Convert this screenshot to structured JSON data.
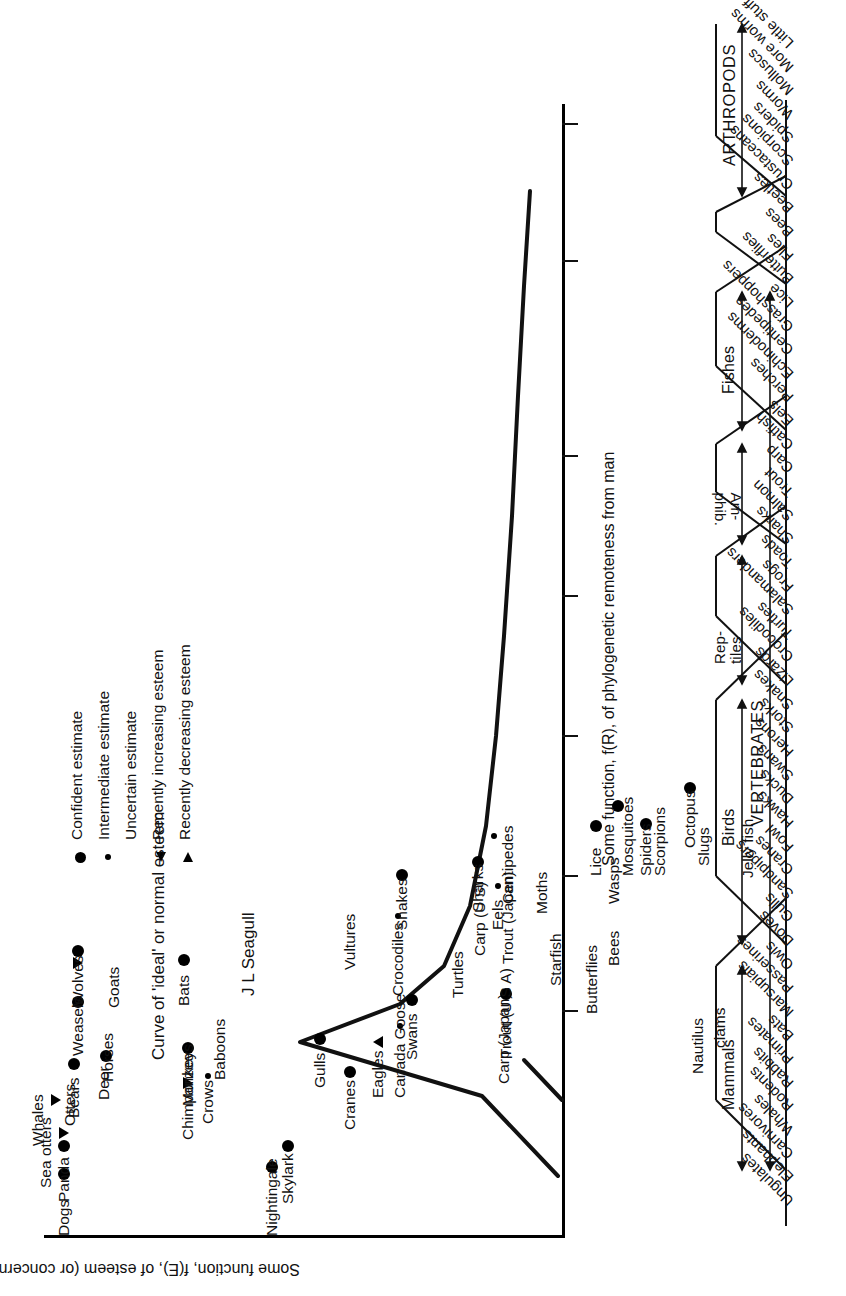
{
  "figure": {
    "y_axis_title": "Some function, f(E), of esteem (or concern) for animals",
    "x_axis_title": "Some function, f(R), of phylogenetic remoteness from man",
    "curve_annotation": "Curve of 'ideal' or normal esteem",
    "seagull_annotation": "J L Seagull"
  },
  "legend": {
    "items": [
      {
        "marker": "large-filled-circle",
        "label": "Confident estimate"
      },
      {
        "marker": "small-filled-circle",
        "label": "Intermediate estimate"
      },
      {
        "marker": "none",
        "label": "Uncertain estimate"
      },
      {
        "marker": "left-triangle",
        "label": "Recently increasing esteem"
      },
      {
        "marker": "right-triangle",
        "label": "Recently decreasing esteem"
      }
    ]
  },
  "chart_data": {
    "type": "scatter",
    "title": "",
    "xlabel": "Some function, f(R), of phylogenetic remoteness from man",
    "ylabel": "Some function, f(E), of esteem (or concern) for animals",
    "grid": false,
    "legend_position": "top-left",
    "annotations": [
      "Curve of 'ideal' or normal esteem",
      "J L Seagull"
    ],
    "marker_meaning": {
      "large-filled-circle": "Confident estimate",
      "small-filled-circle": "Intermediate estimate",
      "none": "Uncertain estimate",
      "left-triangle": "Recently increasing esteem",
      "right-triangle": "Recently decreasing esteem"
    },
    "points": [
      {
        "label": "Dogs",
        "x": 0.03,
        "y": 0.945,
        "marker": "large-filled-circle"
      },
      {
        "label": "Panda",
        "x": 0.075,
        "y": 0.945,
        "marker": "large-filled-circle"
      },
      {
        "label": "Sea otters",
        "x": 0.1,
        "y": 0.945,
        "marker": "left-triangle"
      },
      {
        "label": "Whales",
        "x": 0.14,
        "y": 0.9,
        "marker": "left-triangle"
      },
      {
        "label": "Otters",
        "x": 0.17,
        "y": 0.92,
        "marker": "none"
      },
      {
        "label": "Bears",
        "x": 0.19,
        "y": 0.94,
        "marker": "large-filled-circle"
      },
      {
        "label": "Deer",
        "x": 0.21,
        "y": 0.97,
        "marker": "large-filled-circle"
      },
      {
        "label": "Horses",
        "x": 0.225,
        "y": 0.965,
        "marker": "none"
      },
      {
        "label": "Weasels",
        "x": 0.27,
        "y": 0.945,
        "marker": "large-filled-circle"
      },
      {
        "label": "Goats",
        "x": 0.315,
        "y": 0.955,
        "marker": "none"
      },
      {
        "label": "Wolves",
        "x": 0.318,
        "y": 0.945,
        "marker": "left-triangle"
      },
      {
        "label": "Nightingale",
        "x": 0.055,
        "y": 0.16,
        "marker": "large-filled-circle"
      },
      {
        "label": "Skylark",
        "x": 0.075,
        "y": 0.18,
        "marker": "large-filled-circle"
      },
      {
        "label": "Chimpanzee",
        "x": 0.2,
        "y": 0.43,
        "marker": "left-triangle"
      },
      {
        "label": "Crows",
        "x": 0.215,
        "y": 0.455,
        "marker": "small-filled-circle"
      },
      {
        "label": "Monkeys",
        "x": 0.245,
        "y": 0.43,
        "marker": "large-filled-circle"
      },
      {
        "label": "Baboons",
        "x": 0.278,
        "y": 0.43,
        "marker": "none"
      },
      {
        "label": "Bats",
        "x": 0.33,
        "y": 0.43,
        "marker": "large-filled-circle"
      },
      {
        "label": "Cranes",
        "x": 0.225,
        "y": 0.6,
        "marker": "large-filled-circle"
      },
      {
        "label": "Gulls",
        "x": 0.255,
        "y": 0.56,
        "marker": "large-filled-circle"
      },
      {
        "label": "Eagles",
        "x": 0.25,
        "y": 0.64,
        "marker": "right-triangle"
      },
      {
        "label": "Canada Goose",
        "x": 0.265,
        "y": 0.67,
        "marker": "small-filled-circle"
      },
      {
        "label": "Swans",
        "x": 0.285,
        "y": 0.69,
        "marker": "large-filled-circle"
      },
      {
        "label": "Vultures",
        "x": 0.365,
        "y": 0.57,
        "marker": "none"
      },
      {
        "label": "Crocodiles",
        "x": 0.375,
        "y": 0.68,
        "marker": "small-filled-circle"
      },
      {
        "label": "Snakes",
        "x": 0.418,
        "y": 0.69,
        "marker": "large-filled-circle"
      },
      {
        "label": "Turtles",
        "x": 0.35,
        "y": 0.76,
        "marker": "none"
      },
      {
        "label": "Carp (Japan)",
        "x": 0.27,
        "y": 0.845,
        "marker": "none"
      },
      {
        "label": "Trout (U S A)",
        "x": 0.3,
        "y": 0.85,
        "marker": "large-filled-circle"
      },
      {
        "label": "Carp (U S)",
        "x": 0.4,
        "y": 0.795,
        "marker": "none"
      },
      {
        "label": "Trout (Japan)",
        "x": 0.39,
        "y": 0.845,
        "marker": "none"
      },
      {
        "label": "Sharks",
        "x": 0.43,
        "y": 0.805,
        "marker": "large-filled-circle"
      },
      {
        "label": "Eels",
        "x": 0.405,
        "y": 0.83,
        "marker": "small-filled-circle"
      },
      {
        "label": "Centipedes",
        "x": 0.447,
        "y": 0.83,
        "marker": "small-filled-circle"
      },
      {
        "label": "Starfish",
        "x": 0.34,
        "y": 0.93,
        "marker": "none"
      },
      {
        "label": "Moths",
        "x": 0.4,
        "y": 0.905,
        "marker": "none"
      },
      {
        "label": "Butterflies",
        "x": 0.33,
        "y": 0.98,
        "marker": "none"
      },
      {
        "label": "Bees",
        "x": 0.355,
        "y": 1.01,
        "marker": "none"
      },
      {
        "label": "Wasps",
        "x": 0.42,
        "y": 1.01,
        "marker": "none"
      },
      {
        "label": "Lice",
        "x": 0.455,
        "y": 0.995,
        "marker": "large-filled-circle"
      },
      {
        "label": "Mosquitoes",
        "x": 0.455,
        "y": 1.01,
        "marker": "none"
      },
      {
        "label": "Spiders",
        "x": 0.468,
        "y": 1.06,
        "marker": "large-filled-circle"
      },
      {
        "label": "Scorpions",
        "x": 0.48,
        "y": 1.02,
        "marker": "large-filled-circle"
      },
      {
        "label": "Nautilus",
        "x": 0.3,
        "y": 1.095,
        "marker": "none"
      },
      {
        "label": "clams",
        "x": 0.315,
        "y": 1.095,
        "marker": "none"
      },
      {
        "label": "Slugs",
        "x": 0.48,
        "y": 1.105,
        "marker": "none"
      },
      {
        "label": "Octopus",
        "x": 0.505,
        "y": 1.09,
        "marker": "large-filled-circle"
      },
      {
        "label": "Jelly fish",
        "x": 0.49,
        "y": 1.15,
        "marker": "none"
      }
    ]
  },
  "phylogeny": {
    "top_brackets": [
      {
        "label": "VERTEBRATES"
      },
      {
        "label": "ARTHROPODS"
      }
    ],
    "groups": [
      {
        "label": "Mammals",
        "members": [
          "Ungulates",
          "Elephants",
          "Carnivores",
          "Whales",
          "Rodents",
          "Rabbits",
          "Primates",
          "Bats",
          "Marsupials"
        ]
      },
      {
        "label": "Birds",
        "members": [
          "Passerines",
          "Owls",
          "Doves",
          "Gulls",
          "Sandpipers",
          "Cranes",
          "Fowl",
          "Hawks",
          "Ducks",
          "Swans",
          "Herons",
          "Storks"
        ]
      },
      {
        "label": "Rep-\ntiles",
        "members": [
          "Snakes",
          "Lizards",
          "Crocodiles",
          "Turtles"
        ]
      },
      {
        "label": "Am-\nphib.",
        "members": [
          "Salamanders",
          "Frogs",
          "Toads"
        ]
      },
      {
        "label": "Fishes",
        "members": [
          "Sharks",
          "Salmon",
          "Trout",
          "Carp",
          "Catfish",
          "Eels",
          "Perches"
        ]
      },
      {
        "label": "",
        "members": [
          "Echinoderms"
        ]
      },
      {
        "label": "ARTHROPODS",
        "members": [
          "Centipedes",
          "Grasshoppers",
          "Lice",
          "Butterflies",
          "Flies",
          "Bees",
          "Beetles",
          "Crustaceans",
          "Scorpions",
          "Spiders"
        ]
      },
      {
        "label": "",
        "members": [
          "Worms",
          "Molluscs",
          "More worms",
          "Little stuff"
        ]
      }
    ],
    "ladder_labels": [
      "Ungulates",
      "Elephants",
      "Carnivores",
      "Whales",
      "Rodents",
      "Rabbits",
      "Primates",
      "Bats",
      "Marsupials",
      "Passerines",
      "Owls",
      "Doves",
      "Gulls",
      "Sandpipers",
      "Cranes",
      "Fowl",
      "Hawks",
      "Ducks",
      "Swans",
      "Herons",
      "Storks",
      "Snakes",
      "Lizards",
      "Crocodiles",
      "Turtles",
      "Salamanders",
      "Frogs",
      "Toads",
      "Sharks",
      "Salmon",
      "Trout",
      "Carp",
      "Catfish",
      "Eels",
      "Perches",
      "Echinoderms",
      "Centipedes",
      "Grasshoppers",
      "Lice",
      "Butterflies",
      "Flies",
      "Bees",
      "Beetles",
      "Crustaceans",
      "Scorpions",
      "Spiders",
      "Worms",
      "Molluscs",
      "More worms",
      "Little stuff"
    ]
  },
  "colors": {
    "ink": "#111111",
    "background": "#ffffff"
  }
}
